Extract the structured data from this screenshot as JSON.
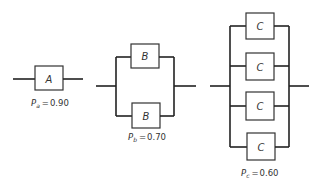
{
  "diagram": {
    "type": "reliability-block-diagram",
    "systems": [
      {
        "id": "A",
        "configuration": "single",
        "component_label": "A",
        "component_count": 1,
        "reliability_symbol": "P",
        "reliability_subscript": "a",
        "reliability_value": "0.90",
        "equals": "="
      },
      {
        "id": "B",
        "configuration": "parallel",
        "component_label": "B",
        "component_count": 2,
        "reliability_symbol": "P",
        "reliability_subscript": "b",
        "reliability_value": "0.70",
        "equals": "="
      },
      {
        "id": "C",
        "configuration": "parallel",
        "component_label": "C",
        "component_count": 4,
        "reliability_symbol": "P",
        "reliability_subscript": "c",
        "reliability_value": "0.60",
        "equals": "="
      }
    ]
  }
}
